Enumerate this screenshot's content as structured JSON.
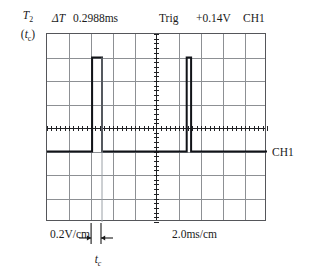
{
  "instrument": {
    "left_caption": {
      "primary": "T",
      "primary_sub": "2",
      "secondary_open": "(",
      "secondary": "t",
      "secondary_sub": "c",
      "secondary_close": ")"
    },
    "readout": {
      "delta_t_label": "ΔT",
      "delta_t_value": "0.2988ms",
      "trigger_label": "Trig",
      "trigger_value": "+0.14V",
      "channel": "CH1"
    },
    "trace_label": "CH1",
    "vertical_scale": "0.2V/cm",
    "horizontal_scale": "2.0ms/cm",
    "pulse_width_label": "t",
    "pulse_width_sub": "c"
  },
  "chart_data": {
    "type": "line",
    "xlabel": "2.0ms/cm",
    "ylabel": "0.2V/cm",
    "grid": true,
    "legend_position": "right",
    "axis_divisions": {
      "x": 10,
      "y": 8
    },
    "div_px": {
      "x": 22,
      "y": 23.5
    },
    "center_div": {
      "x": 5,
      "y": 4
    },
    "units": {
      "x": "ms",
      "y": "V"
    },
    "ms_per_div": 2.0,
    "volts_per_div": 0.2,
    "xlim_div": [
      0,
      10
    ],
    "ylim_div": [
      -4,
      4
    ],
    "baseline_div": -1.0,
    "pulse_top_div": 3.0,
    "measurements": {
      "delta_t_ms": 0.2988,
      "trigger_level_v": 0.14
    },
    "series": [
      {
        "name": "CH1",
        "points_div": [
          [
            0.0,
            -1.0
          ],
          [
            2.05,
            -1.0
          ],
          [
            2.05,
            3.0
          ],
          [
            2.5,
            3.0
          ],
          [
            2.5,
            -1.0
          ],
          [
            6.35,
            -1.0
          ],
          [
            6.35,
            3.0
          ],
          [
            6.55,
            3.0
          ],
          [
            6.55,
            -1.0
          ],
          [
            10.0,
            -1.0
          ]
        ]
      },
      {
        "name": "CH1-ghost",
        "points_div": [
          [
            2.5,
            3.0
          ],
          [
            2.5,
            -4.0
          ]
        ]
      }
    ],
    "pulse_width_marker": {
      "from_div": 2.05,
      "to_div": 2.5,
      "label": "tc"
    }
  }
}
